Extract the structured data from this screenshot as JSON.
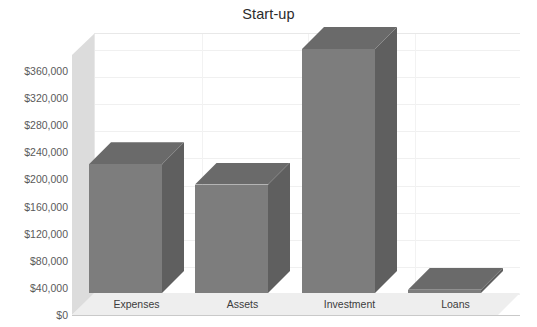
{
  "chart_data": {
    "type": "bar",
    "title": "Start-up",
    "xlabel": "",
    "ylabel": "",
    "categories": [
      "Expenses",
      "Assets",
      "Investment",
      "Loans"
    ],
    "values": [
      190000,
      160000,
      360000,
      5000
    ],
    "ylim": [
      0,
      360000
    ],
    "ytick_values": [
      0,
      40000,
      80000,
      120000,
      160000,
      200000,
      240000,
      280000,
      320000,
      360000
    ],
    "ytick_labels": [
      "$0",
      "$40,000",
      "$80,000",
      "$120,000",
      "$160,000",
      "$200,000",
      "$240,000",
      "$280,000",
      "$320,000",
      "$360,000"
    ],
    "grid": true,
    "legend": false,
    "style_3d": true,
    "colors": {
      "bar_front": "#7d7d7d",
      "bar_top": "#6a6a6a",
      "bar_side": "#5f5f5f",
      "back_wall": "#ffffff",
      "left_wall": "#dcdcdc",
      "floor": "#eeeeee",
      "gridline": "#f0f0f0",
      "title_text": "#2b2b2b",
      "axis_text": "#5a5a5a",
      "category_text": "#3c3c3c"
    }
  }
}
